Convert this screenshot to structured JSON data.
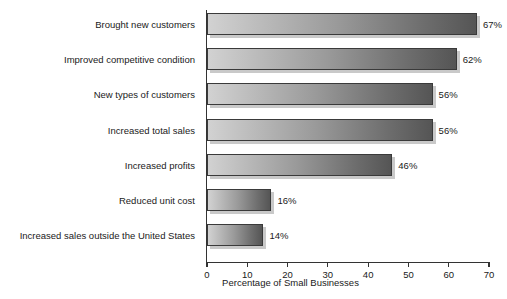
{
  "chart_data": {
    "type": "bar",
    "orientation": "horizontal",
    "title": "",
    "xlabel": "Percentage of Small Businesses",
    "ylabel": "",
    "xlim": [
      0,
      70
    ],
    "xticks": [
      0,
      10,
      20,
      30,
      40,
      50,
      60,
      70
    ],
    "xtick_labels": [
      "0",
      "10",
      "20",
      "30",
      "40",
      "50",
      "60",
      "70"
    ],
    "grid": false,
    "legend": null,
    "value_label_suffix": "%",
    "categories": [
      "Brought new customers",
      "Improved competitive condition",
      "New types of customers",
      "Increased total sales",
      "Increased profits",
      "Reduced unit cost",
      "Increased sales outside the United States"
    ],
    "values": [
      67,
      62,
      56,
      56,
      46,
      16,
      14
    ],
    "value_labels": [
      "67%",
      "62%",
      "56%",
      "56%",
      "46%",
      "16%",
      "14%"
    ],
    "bar_color_light": "#d2d2d2",
    "bar_color_dark": "#555555",
    "bar_border_color": "#3a3a3a",
    "shadow_color": "#c9c9c9",
    "axis_color": "#333333",
    "text_color": "#1a1a1a",
    "background": "#ffffff"
  }
}
